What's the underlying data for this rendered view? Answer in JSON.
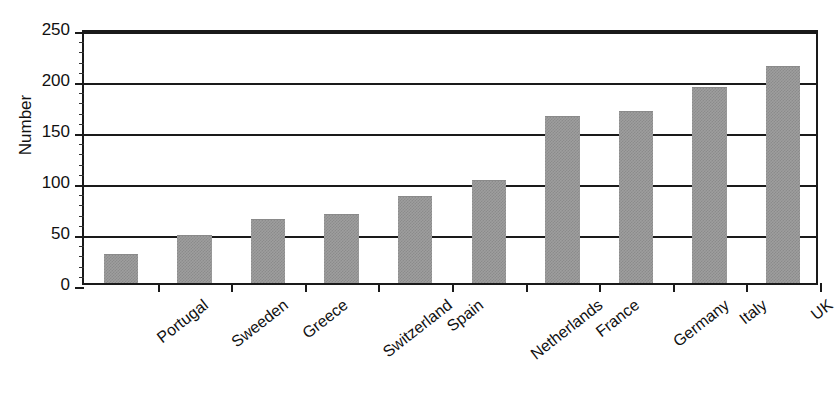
{
  "chart_data": {
    "type": "bar",
    "title": "",
    "xlabel": "",
    "ylabel": "Number",
    "categories": [
      "Portugal",
      "Sweeden",
      "Greece",
      "Switzerland",
      "Spain",
      "Netherlands",
      "France",
      "Germany",
      "Italy",
      "UK"
    ],
    "values": [
      27,
      46,
      62,
      67,
      84,
      100,
      163,
      168,
      191,
      212
    ],
    "ylim": [
      0,
      250
    ],
    "yticks": [
      0,
      50,
      100,
      150,
      200,
      250
    ],
    "ytick_labels": [
      "0",
      "50",
      "100",
      "150",
      "200",
      "250"
    ],
    "yminor_step": 10,
    "grid": "horizontal",
    "legend": "none",
    "bar_color": "#9e9e9e",
    "axis_color": "#1a1a1a",
    "background": "#ffffff",
    "series": [
      {
        "name": "Number",
        "values": [
          27,
          46,
          62,
          67,
          84,
          100,
          163,
          168,
          191,
          212
        ]
      }
    ]
  },
  "figure": {
    "title_remnant": ""
  }
}
